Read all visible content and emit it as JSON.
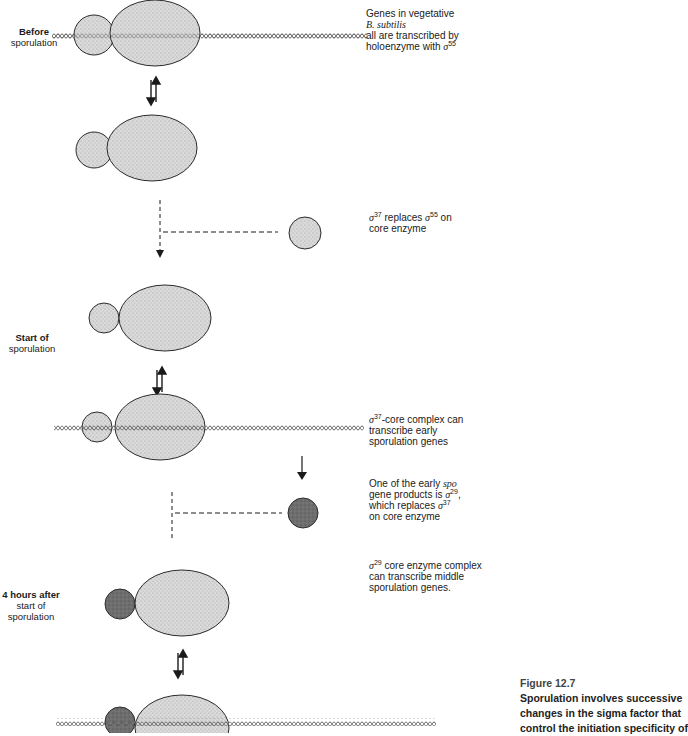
{
  "figure": {
    "number": "Figure 12.7",
    "caption_lines": [
      "Sporulation involves successive",
      "changes in the sigma factor that",
      "control the initiation specificity of"
    ]
  },
  "colors": {
    "core_fill": "#d6d6d6",
    "sigma55_fill": "#d6d6d6",
    "sigma37_fill": "#d0d0d0",
    "sigma29_fill": "#6a6a6a",
    "outline": "#2b2b2b",
    "dna": "#555555"
  },
  "stages": [
    {
      "bold": "Before",
      "rest": "sporulation"
    },
    {
      "bold": "Start of",
      "rest": "sporulation"
    },
    {
      "bold": "4 hours after",
      "rest": "start of sporulation"
    }
  ],
  "annotations": {
    "vegetative": {
      "line1": "Genes in vegetative",
      "line2": "B. subtilis",
      "line3": "all are transcribed by",
      "line4_pre": "holoenzyme with ",
      "sigma": "σ",
      "sup": "55"
    },
    "replace37": {
      "sigma_a": "σ",
      "sup_a": "37",
      "mid": " replaces ",
      "sigma_b": "σ",
      "sup_b": "55",
      "end": " on",
      "line2": "core enzyme"
    },
    "complex37": {
      "sigma": "σ",
      "sup": "37",
      "line1_rest": "-core complex can",
      "line2": "transcribe early",
      "line3": "sporulation genes"
    },
    "spo29": {
      "line1_pre": "One of the early ",
      "line1_it": "spo",
      "line2_pre": "gene products is ",
      "sigma_a": "σ",
      "sup_a": "29",
      "line2_end": ",",
      "line3_pre": "which replaces ",
      "sigma_b": "σ",
      "sup_b": "37",
      "line4": "on core enzyme"
    },
    "complex29": {
      "sigma": "σ",
      "sup": "29",
      "line1_rest": " core enzyme complex",
      "line2": "can transcribe middle",
      "line3": "sporulation genes."
    }
  }
}
